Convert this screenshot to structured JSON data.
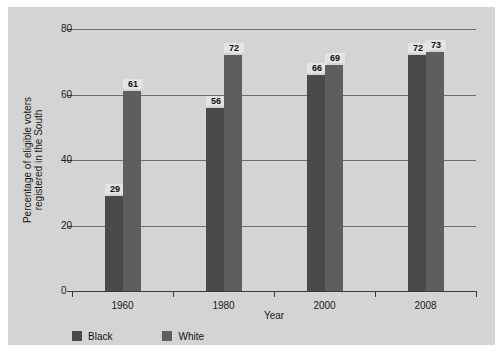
{
  "chart_data": {
    "type": "bar",
    "title": "",
    "xlabel": "Year",
    "ylabel_line1": "Percentage of eligible voters",
    "ylabel_line2": "registered in the South",
    "categories": [
      "1960",
      "1980",
      "2000",
      "2008"
    ],
    "series": [
      {
        "name": "Black",
        "color": "#4a4a4a",
        "values": [
          29,
          56,
          66,
          72
        ]
      },
      {
        "name": "White",
        "color": "#5e5e5e",
        "values": [
          61,
          72,
          69,
          73
        ]
      }
    ],
    "ylim": [
      0,
      80
    ],
    "yticks": [
      0,
      20,
      40,
      60,
      80
    ],
    "ytick_labels": [
      "0",
      "20",
      "40",
      "60",
      "80"
    ],
    "grid": "horizontal",
    "legend_position": "bottom-left"
  },
  "legend": {
    "items": [
      {
        "label": "Black",
        "color": "#4a4a4a"
      },
      {
        "label": "White",
        "color": "#5e5e5e"
      }
    ]
  },
  "colors": {
    "figure_background": "#d4d4d4",
    "page_background": "#ffffff",
    "grid": "#6e6e6e",
    "axis": "#3a3a3a",
    "text": "#1a1a1a",
    "value_label_background": "#e4e4e4"
  }
}
